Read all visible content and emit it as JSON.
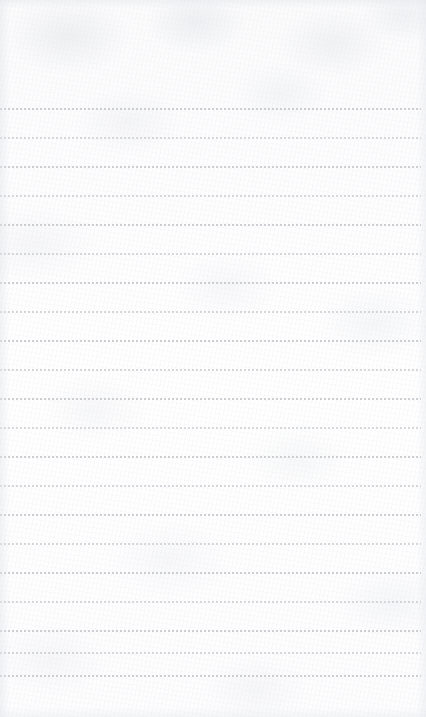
{
  "page": {
    "name": "blank-lined-notepaper",
    "kind": "ruled notepaper sheet",
    "width_px": 426,
    "height_px": 717,
    "text_content": "",
    "visible_text": "",
    "has_handwriting": false,
    "has_printed_text": false
  },
  "paper": {
    "background_color": "#fdfdfd",
    "texture": "mottled fibrous paper grain",
    "vignette_color": "#e2e4e8"
  },
  "ruling": {
    "style": "dotted",
    "line_color": "#c9cace",
    "dot_width_px": 2,
    "dot_gap_px": 2,
    "line_thickness_px": 2,
    "line_spacing_px": 29,
    "first_line_y_px": 108,
    "last_line_y_px": 675,
    "line_start_x_px": 0,
    "line_end_x_px": 421,
    "line_count": 21,
    "top_margin_px": 108,
    "bottom_margin_px": 42,
    "lines": [
      {
        "index": 1,
        "y": 108,
        "faint": false
      },
      {
        "index": 2,
        "y": 137,
        "faint": true
      },
      {
        "index": 3,
        "y": 166,
        "faint": false
      },
      {
        "index": 4,
        "y": 195,
        "faint": true
      },
      {
        "index": 5,
        "y": 224,
        "faint": false
      },
      {
        "index": 6,
        "y": 253,
        "faint": true
      },
      {
        "index": 7,
        "y": 282,
        "faint": false
      },
      {
        "index": 8,
        "y": 311,
        "faint": true
      },
      {
        "index": 9,
        "y": 340,
        "faint": false
      },
      {
        "index": 10,
        "y": 369,
        "faint": true
      },
      {
        "index": 11,
        "y": 398,
        "faint": false
      },
      {
        "index": 12,
        "y": 427,
        "faint": true
      },
      {
        "index": 13,
        "y": 456,
        "faint": false
      },
      {
        "index": 14,
        "y": 485,
        "faint": true
      },
      {
        "index": 15,
        "y": 514,
        "faint": false
      },
      {
        "index": 16,
        "y": 543,
        "faint": true
      },
      {
        "index": 17,
        "y": 572,
        "faint": false
      },
      {
        "index": 18,
        "y": 601,
        "faint": true
      },
      {
        "index": 19,
        "y": 630,
        "faint": false
      },
      {
        "index": 20,
        "y": 652,
        "faint": true
      },
      {
        "index": 21,
        "y": 675,
        "faint": false
      }
    ]
  }
}
